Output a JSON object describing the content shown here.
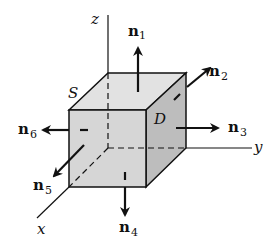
{
  "figure": {
    "colors": {
      "background": "#ffffff",
      "front_face": "#d6d6d6",
      "top_face": "#e2e2e2",
      "side_face": "#bdbdbd",
      "stroke": "#111111"
    },
    "axes": {
      "z": "z",
      "y": "y",
      "x": "x"
    },
    "region_labels": {
      "surface": "S",
      "solid": "D"
    },
    "normals": [
      {
        "id": "n1",
        "base": "n",
        "sub": "1",
        "direction": "up (+z)"
      },
      {
        "id": "n2",
        "base": "n",
        "sub": "2",
        "direction": "back-right"
      },
      {
        "id": "n3",
        "base": "n",
        "sub": "3",
        "direction": "right (+y)"
      },
      {
        "id": "n4",
        "base": "n",
        "sub": "4",
        "direction": "down (-z)"
      },
      {
        "id": "n5",
        "base": "n",
        "sub": "5",
        "direction": "front-left (+x)"
      },
      {
        "id": "n6",
        "base": "n",
        "sub": "6",
        "direction": "left (-y)"
      }
    ]
  }
}
